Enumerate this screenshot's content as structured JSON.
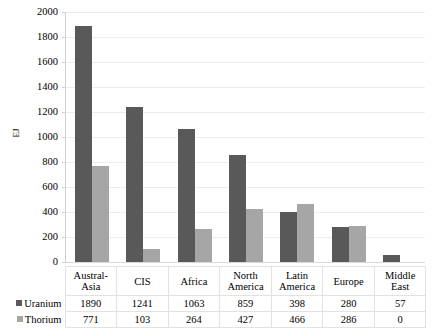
{
  "chart_data": {
    "type": "bar",
    "title": "",
    "xlabel": "",
    "ylabel": "EJ",
    "ylim": [
      0,
      2000
    ],
    "ytick_step": 200,
    "yticks": [
      0,
      200,
      400,
      600,
      800,
      1000,
      1200,
      1400,
      1600,
      1800,
      2000
    ],
    "grid": true,
    "legend_position": "data-table",
    "categories": [
      "Austral-Asia",
      "CIS",
      "Africa",
      "North America",
      "Latin America",
      "Europe",
      "Middle East"
    ],
    "series": [
      {
        "name": "Uranium",
        "color": "#595959",
        "values": [
          1890,
          1241,
          1063,
          859,
          398,
          280,
          57
        ]
      },
      {
        "name": "Thorium",
        "color": "#a6a6a6",
        "values": [
          771,
          103,
          264,
          427,
          466,
          286,
          0
        ]
      }
    ]
  },
  "axis": {
    "y_title": "EJ",
    "tick_labels": [
      "2000",
      "1800",
      "1600",
      "1400",
      "1200",
      "1000",
      "800",
      "600",
      "400",
      "200",
      "0"
    ]
  },
  "table": {
    "category_headers": [
      "Austral-\nAsia",
      "CIS",
      "Africa",
      "North\nAmerica",
      "Latin\nAmerica",
      "Europe",
      "Middle\nEast"
    ],
    "rows": [
      {
        "series": "Uranium",
        "swatch_color": "#595959",
        "cells": [
          "1890",
          "1241",
          "1063",
          "859",
          "398",
          "280",
          "57"
        ]
      },
      {
        "series": "Thorium",
        "swatch_color": "#a6a6a6",
        "cells": [
          "771",
          "103",
          "264",
          "427",
          "466",
          "286",
          "0"
        ]
      }
    ]
  },
  "colors": {
    "uranium": "#595959",
    "thorium": "#a6a6a6",
    "gridline": "#ededed",
    "table_border": "#e2e2e2",
    "background": "#ffffff"
  }
}
